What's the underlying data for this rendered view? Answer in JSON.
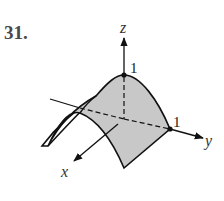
{
  "problem": {
    "number": "31."
  },
  "axes": {
    "z": {
      "label": "z",
      "tick_label": "1"
    },
    "y": {
      "label": "y",
      "tick_label": "1"
    },
    "x": {
      "label": "x"
    }
  },
  "colors": {
    "surface_fill": "#c8c8c8",
    "stroke": "#111111",
    "number": "#4a4a4a"
  }
}
